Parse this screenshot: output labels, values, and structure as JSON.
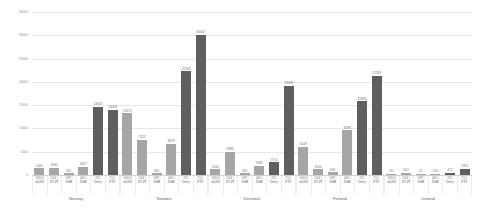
{
  "chart_data": {
    "type": "bar",
    "title": "",
    "xlabel": "",
    "ylabel": "",
    "ylim": [
      0,
      35000
    ],
    "grid": true,
    "legend": "none",
    "ytick_labels": [
      "0",
      "5000",
      "10000",
      "15000",
      "20000",
      "25000",
      "30000",
      "35000"
    ],
    "ytick_values": [
      0,
      5000,
      10000,
      15000,
      20000,
      25000,
      30000,
      35000
    ],
    "port_labels": [
      {
        "port": "5353 |",
        "service": "mDNS"
      },
      {
        "port": "554 |",
        "service": "RTSP"
      },
      {
        "port": "139 |",
        "service": "SMB"
      },
      {
        "port": "445 |",
        "service": "SMB"
      },
      {
        "port": "23 |",
        "service": "Telnet"
      },
      {
        "port": "21 |",
        "service": "FTP"
      }
    ],
    "categories": [
      "Norway",
      "Sweden",
      "Denmark",
      "Finland",
      "Iceland"
    ],
    "groups": [
      {
        "name": "Norway",
        "bars": [
          {
            "label": "1461",
            "value": 1461,
            "shade": "light"
          },
          {
            "label": "1600",
            "value": 1600,
            "shade": "light"
          },
          {
            "label": "341",
            "value": 341,
            "shade": "light"
          },
          {
            "label": "1827",
            "value": 1827,
            "shade": "light"
          },
          {
            "label": "14647",
            "value": 14647,
            "shade": "dark"
          },
          {
            "label": "14008",
            "value": 14008,
            "shade": "dark"
          }
        ]
      },
      {
        "name": "Sweden",
        "bars": [
          {
            "label": "13272",
            "value": 13272,
            "shade": "light"
          },
          {
            "label": "7522",
            "value": 7522,
            "shade": "light"
          },
          {
            "label": "345",
            "value": 345,
            "shade": "light"
          },
          {
            "label": "6679",
            "value": 6679,
            "shade": "light"
          },
          {
            "label": "22263",
            "value": 22263,
            "shade": "dark"
          },
          {
            "label": "30047",
            "value": 30047,
            "shade": "dark"
          }
        ]
      },
      {
        "name": "Denmark",
        "bars": [
          {
            "label": "1204",
            "value": 1204,
            "shade": "light"
          },
          {
            "label": "4983",
            "value": 4983,
            "shade": "light"
          },
          {
            "label": "355",
            "value": 355,
            "shade": "light"
          },
          {
            "label": "1960",
            "value": 1960,
            "shade": "light"
          },
          {
            "label": "2714",
            "value": 2714,
            "shade": "dark"
          },
          {
            "label": "19098",
            "value": 19098,
            "shade": "dark"
          }
        ]
      },
      {
        "name": "Finland",
        "bars": [
          {
            "label": "6109",
            "value": 6109,
            "shade": "light"
          },
          {
            "label": "1204",
            "value": 1204,
            "shade": "light"
          },
          {
            "label": "626",
            "value": 626,
            "shade": "light"
          },
          {
            "label": "9599",
            "value": 9599,
            "shade": "light"
          },
          {
            "label": "15860",
            "value": 15860,
            "shade": "dark"
          },
          {
            "label": "21283",
            "value": 21283,
            "shade": "dark"
          }
        ]
      },
      {
        "name": "Iceland",
        "bars": [
          {
            "label": "65",
            "value": 65,
            "shade": "light"
          },
          {
            "label": "502",
            "value": 502,
            "shade": "light"
          },
          {
            "label": "21",
            "value": 21,
            "shade": "light"
          },
          {
            "label": "213",
            "value": 213,
            "shade": "light"
          },
          {
            "label": "417",
            "value": 417,
            "shade": "dark"
          },
          {
            "label": "1351",
            "value": 1351,
            "shade": "dark"
          }
        ]
      }
    ],
    "colors": {
      "bar_light": "#a6a6a6",
      "bar_dark": "#5f5f5f",
      "gridline": "#e8e8e8",
      "text": "#6e6e6e",
      "background": "#ffffff"
    }
  }
}
